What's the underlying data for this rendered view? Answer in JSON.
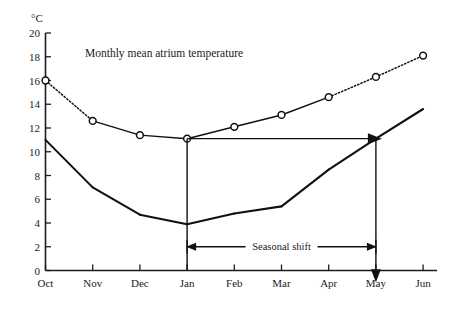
{
  "chart_data": {
    "type": "line",
    "title": "Monthly mean atrium temperature",
    "xlabel": "",
    "ylabel": "°C",
    "ylim": [
      0,
      20
    ],
    "ytick_labels": [
      "0",
      "2",
      "4",
      "6",
      "8",
      "10",
      "12",
      "14",
      "16",
      "18",
      "20"
    ],
    "ytick_values": [
      0,
      2,
      4,
      6,
      8,
      10,
      12,
      14,
      16,
      18,
      20
    ],
    "grid": false,
    "legend": "none",
    "categories": [
      "Oct",
      "Nov",
      "Dec",
      "Jan",
      "Feb",
      "Mar",
      "Apr",
      "May",
      "Jun"
    ],
    "series": [
      {
        "name": "Atrium temperature (with markers)",
        "marker": "open-circle",
        "values": [
          16.0,
          12.6,
          11.4,
          11.1,
          12.1,
          13.1,
          14.6,
          16.3,
          18.1
        ],
        "segment_styles": [
          "dotted",
          "solid",
          "solid",
          "solid",
          "solid",
          "solid",
          "dotted",
          "dotted"
        ]
      },
      {
        "name": "Outdoor temperature",
        "marker": "none",
        "values": [
          11.0,
          7.0,
          4.7,
          3.9,
          4.8,
          5.4,
          8.5,
          11.1,
          13.6
        ],
        "segment_styles": [
          "solid",
          "solid",
          "solid",
          "solid",
          "solid",
          "solid",
          "solid",
          "solid"
        ]
      }
    ],
    "annotations": [
      {
        "name": "seasonal-shift-label",
        "text": "Seasonal shift",
        "x_from": "Jan",
        "x_to": "May",
        "y": 2.0,
        "style": "double-headed-arrow"
      },
      {
        "name": "horizontal-shift-arrow",
        "text": "",
        "x_from": "Jan",
        "x_to": "May",
        "y": 11.1,
        "style": "single-headed-arrow"
      },
      {
        "name": "jan-vertical-guide",
        "text": "",
        "x_at": "Jan",
        "y_from": 0.0,
        "y_to": 11.1,
        "style": "vertical-line"
      },
      {
        "name": "may-vertical-arrow",
        "text": "",
        "x_at": "May",
        "y_from": 11.1,
        "y_to": -0.9,
        "style": "vertical-arrow-down"
      }
    ]
  },
  "axis": {
    "y_unit_label": "°C",
    "x_labels": [
      "Oct",
      "Nov",
      "Dec",
      "Jan",
      "Feb",
      "Mar",
      "Apr",
      "May",
      "Jun"
    ],
    "y_labels": [
      "20",
      "18",
      "16",
      "14",
      "12",
      "10",
      "8",
      "6",
      "4",
      "2",
      "0"
    ]
  },
  "annotations": {
    "seasonal_shift": "Seasonal shift"
  },
  "colors": {
    "ink": "#111111",
    "background": "#ffffff"
  }
}
